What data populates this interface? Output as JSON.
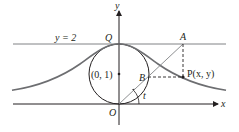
{
  "diagram": {
    "labels": {
      "y_axis": "y",
      "x_axis": "x",
      "line_label": "y = 2",
      "point_Q": "Q",
      "point_A": "A",
      "point_B": "B",
      "point_O": "O",
      "point_P": "P(x, y)",
      "center": "(0, 1)",
      "angle": "t"
    },
    "colors": {
      "axis": "#231f20",
      "curve": "#6d6e71",
      "line": "#808285",
      "text": "#231f20"
    }
  }
}
